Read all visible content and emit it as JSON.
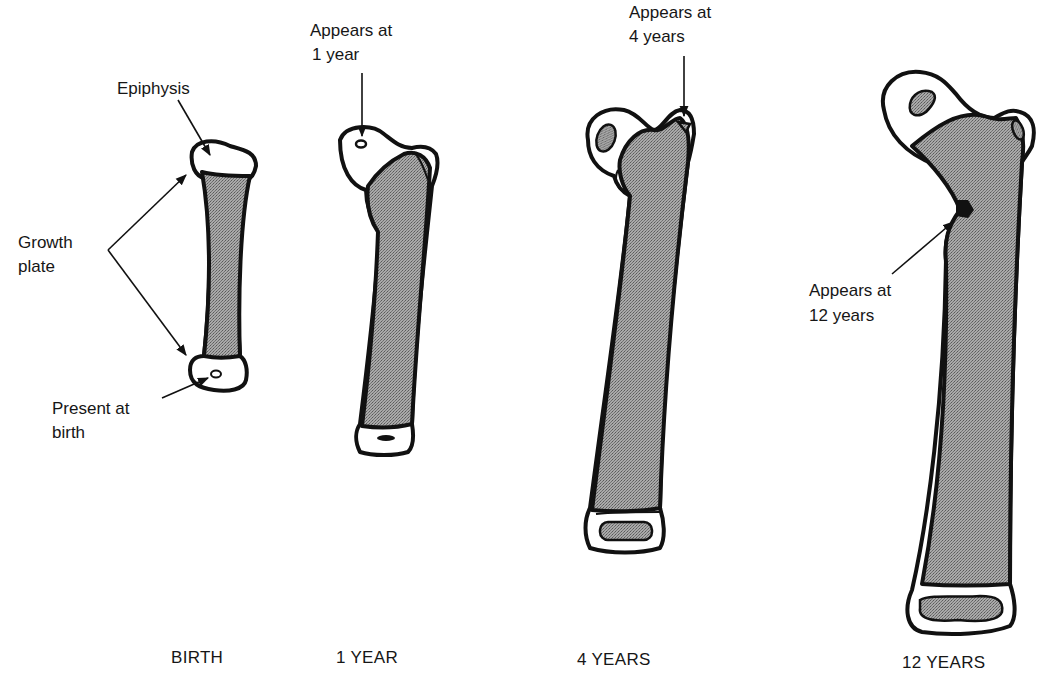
{
  "figure": {
    "colors": {
      "ink": "#111111",
      "stipple": "#8c8c8c",
      "background": "#ffffff"
    }
  },
  "annotations": {
    "epiphysis": "Epiphysis",
    "growth_plate_line1": "Growth",
    "growth_plate_line2": "plate",
    "present_at_birth_line1": "Present at",
    "present_at_birth_line2": "birth",
    "appears_1_year_line1": "Appears at",
    "appears_1_year_line2": "1 year",
    "appears_4_years_line1": "Appears at",
    "appears_4_years_line2": "4 years",
    "appears_12_years_line1": "Appears at",
    "appears_12_years_line2": "12 years"
  },
  "stages": [
    {
      "caption": "BIRTH"
    },
    {
      "caption": "1 YEAR"
    },
    {
      "caption": "4 YEARS"
    },
    {
      "caption": "12 YEARS"
    }
  ]
}
